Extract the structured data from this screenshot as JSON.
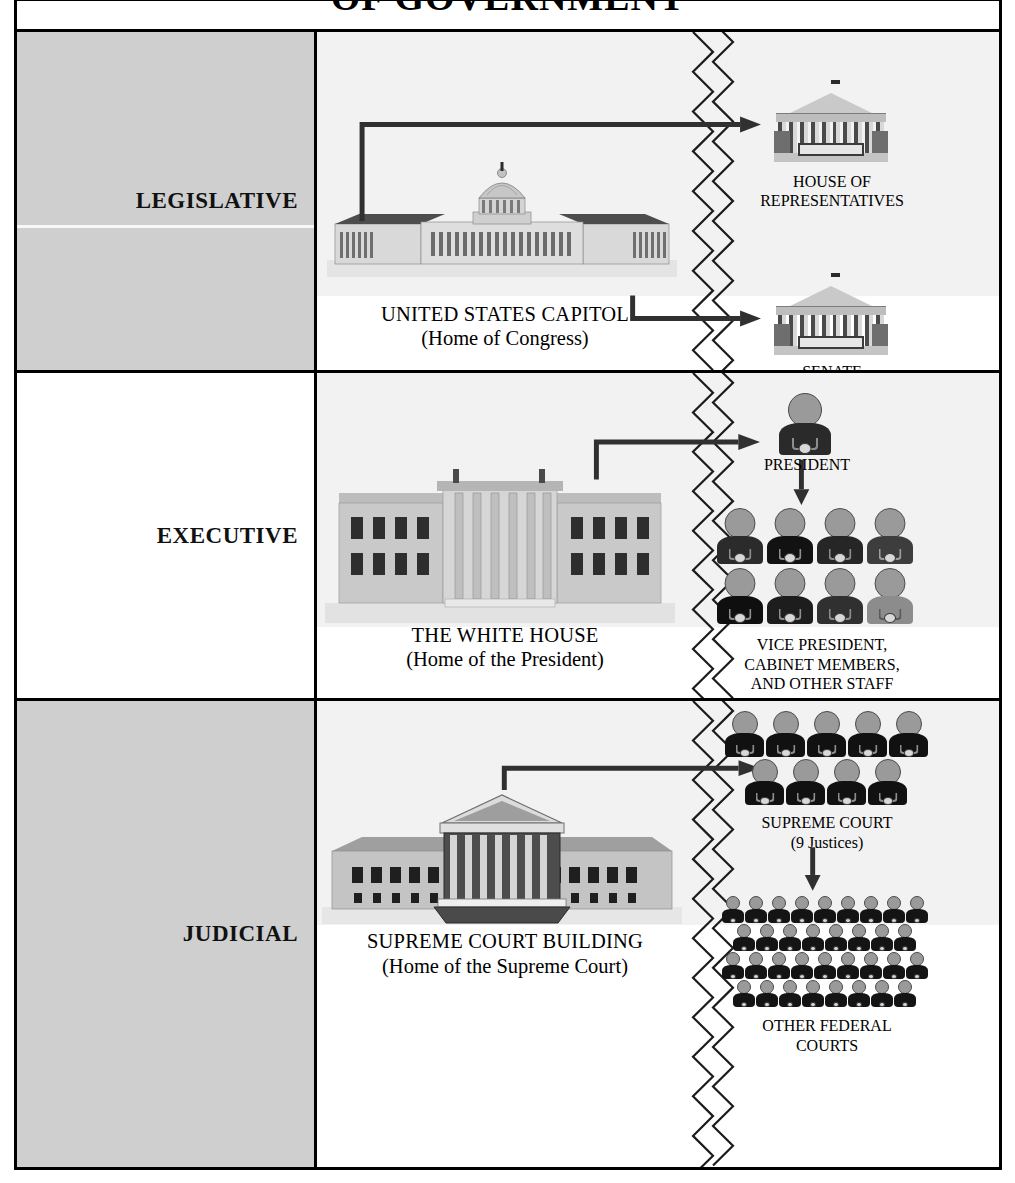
{
  "title": "OF GOVERNMENT",
  "title_full": "THE THREE BRANCHES OF GOVERNMENT",
  "rows": [
    {
      "branch": "LEGISLATIVE",
      "shaded": true,
      "building": {
        "name": "UNITED STATES CAPITOL",
        "subtitle": "(Home of Congress)",
        "icon": "capitol-building"
      },
      "members": [
        {
          "label_line1": "HOUSE OF",
          "label_line2": "REPRESENTATIVES",
          "icon": "classical-building-icon"
        },
        {
          "label_line1": "SENATE",
          "label_line2": "",
          "icon": "classical-building-icon"
        }
      ]
    },
    {
      "branch": "EXECUTIVE",
      "shaded": false,
      "building": {
        "name": "THE WHITE HOUSE",
        "subtitle": "(Home of the President)",
        "icon": "white-house-building"
      },
      "members": [
        {
          "label_line1": "PRESIDENT",
          "label_line2": "",
          "icon": "person-icon",
          "count": 1
        },
        {
          "label_line1": "VICE PRESIDENT,",
          "label_line2": "CABINET MEMBERS,",
          "label_line3": "AND OTHER STAFF",
          "icon": "people-group-icon",
          "count": 8
        }
      ]
    },
    {
      "branch": "JUDICIAL",
      "shaded": true,
      "building": {
        "name": "SUPREME COURT BUILDING",
        "subtitle": "(Home of the Supreme Court)",
        "icon": "supreme-court-building"
      },
      "members": [
        {
          "label_line1": "SUPREME COURT",
          "label_line2": "(9 Justices)",
          "icon": "people-group-icon",
          "count": 9
        },
        {
          "label_line1": "OTHER FEDERAL",
          "label_line2": "COURTS",
          "icon": "people-crowd-icon",
          "count": 34
        }
      ]
    }
  ],
  "colors": {
    "frame": "#000000",
    "shaded_cell": "#cfcfcf",
    "background_wash": "#f2f2f2",
    "arrow": "#303030"
  }
}
